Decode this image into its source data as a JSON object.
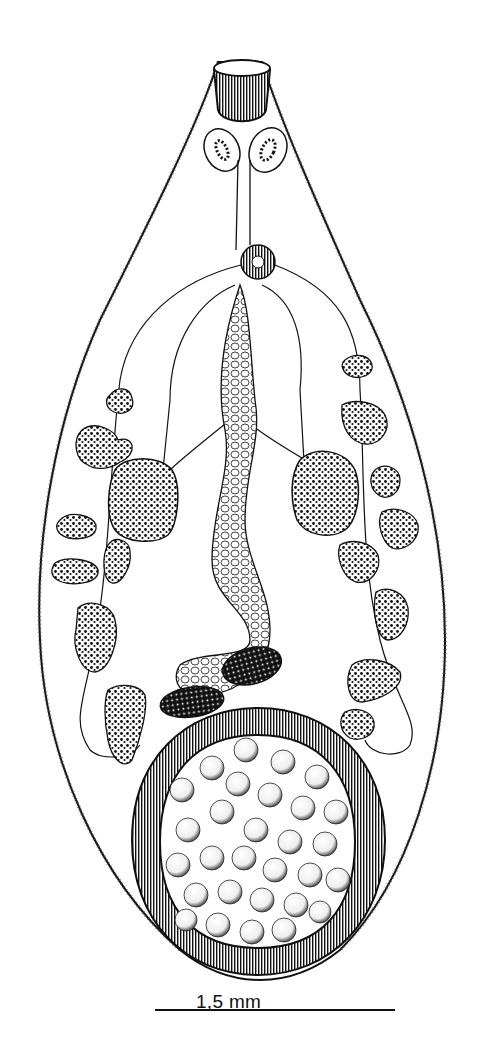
{
  "figure": {
    "scale_bar": {
      "label": "1,5 mm",
      "x1": 155,
      "x2": 395,
      "y": 1010
    },
    "colors": {
      "ink": "#111111",
      "background": "#ffffff",
      "stipple": "#2a2a2a"
    },
    "structures": [
      {
        "name": "oral-sucker",
        "cx": 242,
        "cy": 92
      },
      {
        "name": "eyespot-left",
        "cx": 222,
        "cy": 150
      },
      {
        "name": "eyespot-right",
        "cx": 268,
        "cy": 150
      },
      {
        "name": "pharynx-ring",
        "cx": 258,
        "cy": 262
      },
      {
        "name": "testis-left",
        "cx": 143,
        "cy": 500
      },
      {
        "name": "testis-right",
        "cx": 328,
        "cy": 490
      },
      {
        "name": "ovary",
        "cx": 252,
        "cy": 666
      },
      {
        "name": "ventral-sucker-acetabulum",
        "cx": 258,
        "cy": 836
      }
    ]
  }
}
